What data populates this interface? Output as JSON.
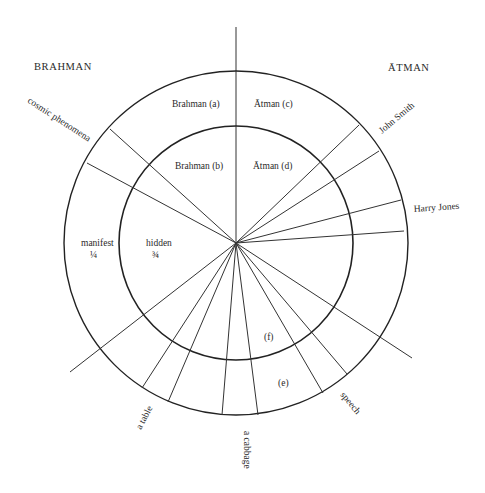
{
  "diagram": {
    "center": {
      "x": 236,
      "y": 243
    },
    "outer_radius": 172,
    "inner_radius": 117,
    "colors": {
      "line": "#222222",
      "text": "#2a2a2a",
      "background": "#ffffff"
    },
    "headings": {
      "brahman": "BRAHMAN",
      "atman": "ĀTMAN"
    },
    "quadrant_labels": {
      "brahman_a": "Brahman (a)",
      "atman_c": "Ātman (c)",
      "brahman_b": "Brahman (b)",
      "atman_d": "Ātman (d)"
    },
    "proportion_labels": {
      "manifest": "manifest",
      "manifest_fraction": "¼",
      "hidden": "hidden",
      "hidden_fraction": "¾"
    },
    "segment_labels": {
      "f": "(f)",
      "e": "(e)"
    },
    "ray_labels": {
      "cosmic_phenomena": "cosmic phenomena",
      "john_smith": "John Smith",
      "harry_jones": "Harry Jones",
      "speech": "speech",
      "a_cabbage": "a cabbage",
      "a_table": "a table"
    }
  }
}
